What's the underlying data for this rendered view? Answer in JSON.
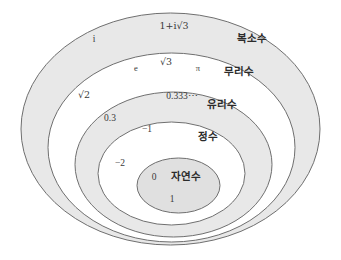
{
  "diagram": {
    "colors": {
      "stroke": "#6f6f6f",
      "shaded_fill": "#e8e8e8",
      "plain_fill": "#ffffff",
      "text": "#3a3a3a",
      "label_text": "#2b2b2b",
      "background": "#ffffff"
    },
    "sets": [
      {
        "id": "complex",
        "label": "복소수",
        "label_x": 252,
        "label_y": 42,
        "ellipse": {
          "cx": 170.5,
          "cy": 129,
          "rx": 149.5,
          "ry": 116
        },
        "fill": "shaded",
        "members": [
          {
            "text": "i",
            "x": 94,
            "y": 42,
            "size": "normal"
          },
          {
            "text": "1+i√3",
            "x": 174,
            "y": 29,
            "size": "normal"
          }
        ]
      },
      {
        "id": "irrational",
        "label": "무리수",
        "label_x": 239,
        "label_y": 75,
        "ellipse": {
          "cx": 171.5,
          "cy": 147.5,
          "rx": 123.5,
          "ry": 94.5
        },
        "fill": "plain",
        "members": [
          {
            "text": "e",
            "x": 136,
            "y": 71,
            "size": "small"
          },
          {
            "text": "√3",
            "x": 166,
            "y": 65,
            "size": "normal"
          },
          {
            "text": "π",
            "x": 198,
            "y": 71,
            "size": "small"
          },
          {
            "text": "√2",
            "x": 84,
            "y": 98,
            "size": "normal"
          }
        ]
      },
      {
        "id": "rational",
        "label": "유리수",
        "label_x": 222,
        "label_y": 108,
        "ellipse": {
          "cx": 173.5,
          "cy": 164.5,
          "rx": 98.5,
          "ry": 72.5
        },
        "fill": "shaded",
        "members": [
          {
            "text": "0.333⋯",
            "x": 182,
            "y": 99,
            "size": "normal"
          },
          {
            "text": "0.3",
            "x": 110,
            "y": 121,
            "size": "normal"
          }
        ]
      },
      {
        "id": "integer",
        "label": "정수",
        "label_x": 208,
        "label_y": 140,
        "ellipse": {
          "cx": 171.5,
          "cy": 173.5,
          "rx": 73.5,
          "ry": 51.5
        },
        "fill": "plain",
        "members": [
          {
            "text": "−1",
            "x": 147,
            "y": 132,
            "size": "normal"
          },
          {
            "text": "−2",
            "x": 120,
            "y": 166,
            "size": "normal"
          }
        ]
      },
      {
        "id": "natural",
        "label": "자연수",
        "label_x": 186,
        "label_y": 180,
        "ellipse": {
          "cx": 178.5,
          "cy": 185.5,
          "rx": 41.5,
          "ry": 27.5
        },
        "fill": "shaded",
        "members": [
          {
            "text": "0",
            "x": 154,
            "y": 180,
            "size": "normal"
          },
          {
            "text": "1",
            "x": 172,
            "y": 202,
            "size": "normal"
          }
        ]
      }
    ]
  }
}
